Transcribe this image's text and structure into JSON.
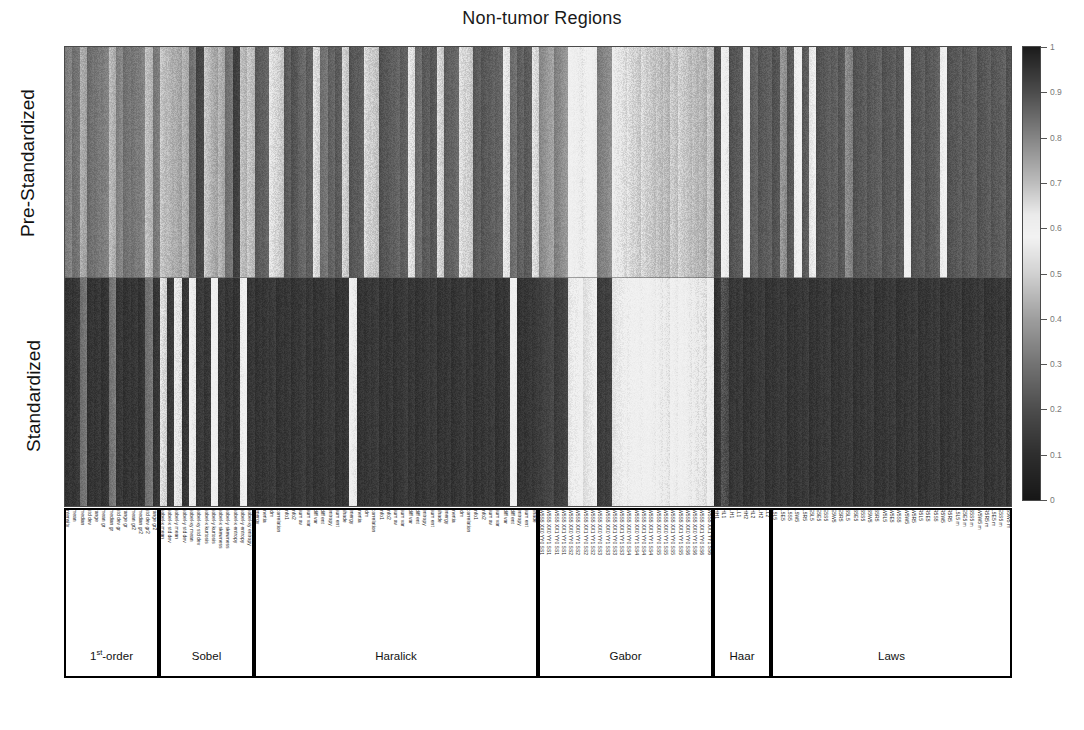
{
  "title": "Non-tumor Regions",
  "rows": [
    {
      "label": "Pre-Standardized"
    },
    {
      "label": "Standardized"
    }
  ],
  "colorbar": {
    "min_label": "0",
    "max_label": "1",
    "ticks": [
      "0",
      "0.1",
      "0.2",
      "0.3",
      "0.4",
      "0.5",
      "0.6",
      "0.7",
      "0.8",
      "0.9",
      "1"
    ],
    "tick_values": [
      0,
      0.1,
      0.2,
      0.3,
      0.4,
      0.5,
      0.6,
      0.7,
      0.8,
      0.9,
      1
    ],
    "colormap": "gray-bone-diverging",
    "dark_hex": "#151515",
    "light_hex": "#f2f2f2"
  },
  "groups": [
    {
      "name": "1st-order",
      "name_html": "1<sup>st</sup>-order",
      "start": 0,
      "count": 13
    },
    {
      "name": "Sobel",
      "start": 13,
      "count": 13
    },
    {
      "name": "Haralick",
      "start": 26,
      "count": 39
    },
    {
      "name": "Gabor",
      "start": 65,
      "count": 24
    },
    {
      "name": "Haar",
      "start": 89,
      "count": 8
    },
    {
      "name": "Laws",
      "start": 97,
      "count": 33
    }
  ],
  "feature_labels": [
    "intensity",
    "mean",
    "median",
    "std dev",
    "range",
    "mean gr",
    "median gr",
    "std dev gr",
    "range gr",
    "mean gr2",
    "median gr2",
    "std dev gr2",
    "range gr2",
    "sobel-x mean",
    "sobel-x std dev",
    "sobel-y mean",
    "sobel-y std dev",
    "sobel-xy mean",
    "sobel-xy std dev",
    "sobel-x kurtosis",
    "sobel-y kurtosis",
    "sobel-x skewness",
    "sobel-y skewness",
    "sobel-x entropy",
    "sobel-y entropy",
    "sobel-xy entropy",
    "energy",
    "inertia",
    "idm",
    "correlation",
    "info1",
    "info2",
    "sum av",
    "sum var",
    "diff var",
    "diff ent",
    "entropy",
    "sum ent",
    "shade",
    "energy",
    "inertia",
    "idm",
    "correlation",
    "info1",
    "info2",
    "sum av",
    "sum var",
    "diff var",
    "diff ent",
    "entropy",
    "sum ent",
    "shade",
    "energy",
    "inertia",
    "idm",
    "correlation",
    "info1",
    "info2",
    "sum av",
    "sum var",
    "diff var",
    "diff ent",
    "entropy",
    "sum ent",
    "shade",
    "W5S5 XX0 YY0 SS1",
    "W5S5 XX0 YY1 SS1",
    "W5S5 XX1 YY0 SS1",
    "W5S5 XX1 YY1 SS1",
    "W5S5 XX0 YY0 SS2",
    "W5S5 XX0 YY1 SS2",
    "W5S5 XX1 YY0 SS2",
    "W5S5 XX1 YY1 SS2",
    "W5S5 XX0 YY0 SS3",
    "W5S5 XX0 YY1 SS3",
    "W5S5 XX1 YY0 SS3",
    "W5S5 XX1 YY1 SS3",
    "W5S5 XX0 YY0 SS4",
    "W5S5 XX0 YY1 SS4",
    "W5S5 XX1 YY0 SS4",
    "W5S5 XX1 YY1 SS4",
    "W5S5 XX0 YY0 SS5",
    "W5S5 XX0 YY1 SS5",
    "W5S5 XX1 YY0 SS5",
    "W5S5 XX1 YY1 SS5",
    "W5S5 XX0 YY0 SS6",
    "W5S5 XX0 YY1 SS6",
    "W5S5 XX1 YY0 SS6",
    "W5S5 XX1 YY1 SS6",
    "HH1",
    "HL1",
    "LH1",
    "LL1",
    "HH2",
    "HL2",
    "LH2",
    "LL2",
    "L5L5",
    "L5E5",
    "L5S5",
    "L5W5",
    "L5R5",
    "E5L5",
    "E5E5",
    "E5S5",
    "E5W5",
    "E5R5",
    "S5L5",
    "S5E5",
    "S5S5",
    "S5W5",
    "S5R5",
    "W5L5",
    "W5E5",
    "W5S5",
    "W5W5",
    "W5R5",
    "R5L5",
    "R5E5",
    "R5S5",
    "R5W5",
    "R5R5",
    "L5L5 m",
    "E5E5 m",
    "S5S5 m",
    "W5W5 m",
    "R5R5 m",
    "L5E5 m",
    "E5S5 m",
    "S5W5 m"
  ],
  "chart_data": {
    "type": "heatmap",
    "title": "Non-tumor Regions",
    "xlabel": "",
    "ylabel": "",
    "row_labels": [
      "Pre-Standardized",
      "Standardized"
    ],
    "colorbar_range": [
      0,
      1
    ],
    "n_columns": 130,
    "series": [
      {
        "name": "Pre-Standardized",
        "values": [
          0.33,
          0.3,
          0.74,
          0.29,
          0.31,
          0.33,
          0.72,
          0.34,
          0.3,
          0.31,
          0.33,
          0.71,
          0.32,
          0.7,
          0.72,
          0.74,
          0.73,
          0.3,
          0.18,
          0.7,
          0.74,
          0.73,
          0.3,
          0.16,
          0.71,
          0.7,
          0.24,
          0.26,
          0.65,
          0.68,
          0.24,
          0.22,
          0.27,
          0.25,
          0.66,
          0.3,
          0.26,
          0.24,
          0.68,
          0.23,
          0.25,
          0.67,
          0.69,
          0.22,
          0.24,
          0.26,
          0.25,
          0.65,
          0.28,
          0.24,
          0.23,
          0.67,
          0.25,
          0.27,
          0.66,
          0.68,
          0.24,
          0.23,
          0.25,
          0.26,
          0.64,
          0.29,
          0.25,
          0.24,
          0.66,
          0.36,
          0.4,
          0.34,
          0.38,
          0.6,
          0.62,
          0.58,
          0.61,
          0.33,
          0.36,
          0.63,
          0.65,
          0.66,
          0.68,
          0.67,
          0.69,
          0.7,
          0.71,
          0.69,
          0.68,
          0.7,
          0.71,
          0.72,
          0.7,
          0.2,
          0.62,
          0.22,
          0.24,
          0.6,
          0.26,
          0.23,
          0.25,
          0.22,
          0.78,
          0.23,
          0.58,
          0.24,
          0.56,
          0.22,
          0.24,
          0.25,
          0.23,
          0.8,
          0.22,
          0.24,
          0.23,
          0.25,
          0.22,
          0.24,
          0.23,
          0.6,
          0.22,
          0.24,
          0.23,
          0.25,
          0.58,
          0.22,
          0.24,
          0.23,
          0.25,
          0.22,
          0.24,
          0.23,
          0.25,
          0.22
        ]
      },
      {
        "name": "Standardized",
        "values": [
          0.12,
          0.13,
          0.3,
          0.12,
          0.13,
          0.12,
          0.31,
          0.13,
          0.12,
          0.13,
          0.12,
          0.3,
          0.13,
          0.66,
          0.14,
          0.64,
          0.13,
          0.62,
          0.14,
          0.13,
          0.6,
          0.14,
          0.13,
          0.12,
          0.58,
          0.13,
          0.12,
          0.13,
          0.14,
          0.12,
          0.13,
          0.12,
          0.14,
          0.13,
          0.12,
          0.13,
          0.14,
          0.12,
          0.13,
          0.62,
          0.12,
          0.13,
          0.14,
          0.12,
          0.13,
          0.12,
          0.14,
          0.13,
          0.12,
          0.13,
          0.14,
          0.12,
          0.13,
          0.12,
          0.14,
          0.13,
          0.12,
          0.13,
          0.14,
          0.12,
          0.13,
          0.6,
          0.12,
          0.13,
          0.14,
          0.16,
          0.18,
          0.15,
          0.17,
          0.56,
          0.58,
          0.54,
          0.57,
          0.15,
          0.16,
          0.55,
          0.57,
          0.58,
          0.6,
          0.59,
          0.61,
          0.62,
          0.63,
          0.61,
          0.6,
          0.62,
          0.63,
          0.64,
          0.62,
          0.12,
          0.9,
          0.13,
          0.14,
          0.12,
          0.13,
          0.14,
          0.12,
          0.13,
          0.14,
          0.12,
          0.13,
          0.14,
          0.12,
          0.13,
          0.14,
          0.12,
          0.13,
          0.14,
          0.12,
          0.13,
          0.14,
          0.12,
          0.13,
          0.14,
          0.12,
          0.13,
          0.14,
          0.12,
          0.13,
          0.14,
          0.12,
          0.13,
          0.14,
          0.12,
          0.13,
          0.14,
          0.12,
          0.13,
          0.14,
          0.12
        ]
      }
    ]
  }
}
